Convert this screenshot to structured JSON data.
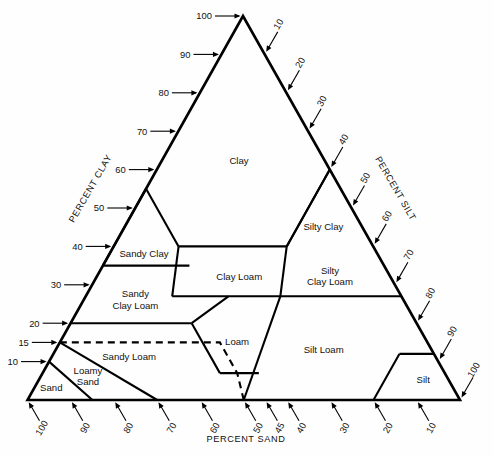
{
  "figure": {
    "line_color": "#000000",
    "background": "#fefefe"
  },
  "axes": {
    "left": {
      "name": "PERCENT CLAY",
      "label": "PERCENT CLAY",
      "ticks": [
        "100",
        "90",
        "80",
        "70",
        "60",
        "50",
        "40",
        "30",
        "20",
        "15",
        "10"
      ],
      "tick_values": [
        100,
        90,
        80,
        70,
        60,
        50,
        40,
        30,
        20,
        15,
        10
      ]
    },
    "right": {
      "name": "PERCENT SILT",
      "label": "PERCENT SILT",
      "ticks": [
        "10",
        "20",
        "30",
        "40",
        "50",
        "60",
        "70",
        "80",
        "90",
        "100"
      ],
      "tick_values": [
        10,
        20,
        30,
        40,
        50,
        60,
        70,
        80,
        90,
        100
      ]
    },
    "bottom": {
      "name": "PERCENT SAND",
      "label": "PERCENT SAND",
      "ticks": [
        "100",
        "90",
        "80",
        "70",
        "60",
        "50",
        "45",
        "40",
        "30",
        "20",
        "10"
      ],
      "tick_values": [
        100,
        90,
        80,
        70,
        60,
        50,
        45,
        40,
        30,
        20,
        10
      ]
    }
  },
  "regions": [
    {
      "id": "clay",
      "label": "Clay",
      "lines": [
        "Clay"
      ]
    },
    {
      "id": "silty-clay",
      "label": "Silty Clay",
      "lines": [
        "Silty Clay"
      ]
    },
    {
      "id": "sandy-clay",
      "label": "Sandy Clay",
      "lines": [
        "Sandy Clay"
      ]
    },
    {
      "id": "clay-loam",
      "label": "Clay Loam",
      "lines": [
        "Clay Loam"
      ]
    },
    {
      "id": "silty-clay-loam",
      "label": "Silty Clay Loam",
      "lines": [
        "Silty",
        "Clay Loam"
      ]
    },
    {
      "id": "sandy-clay-loam",
      "label": "Sandy Clay Loam",
      "lines": [
        "Sandy",
        "Clay Loam"
      ]
    },
    {
      "id": "loam",
      "label": "Loam",
      "lines": [
        "Loam"
      ]
    },
    {
      "id": "silt-loam",
      "label": "Silt Loam",
      "lines": [
        "Silt Loam"
      ]
    },
    {
      "id": "sandy-loam",
      "label": "Sandy Loam",
      "lines": [
        "Sandy Loam"
      ]
    },
    {
      "id": "loamy-sand",
      "label": "Loamy Sand",
      "lines": [
        "Loamy",
        "Sand"
      ]
    },
    {
      "id": "sand",
      "label": "Sand",
      "lines": [
        "Sand"
      ]
    },
    {
      "id": "silt",
      "label": "Silt",
      "lines": [
        "Silt"
      ]
    }
  ],
  "chart_data": {
    "type": "ternary",
    "components": [
      "clay",
      "silt",
      "sand"
    ],
    "axis_ranges": {
      "clay": [
        0,
        100
      ],
      "silt": [
        0,
        100
      ],
      "sand": [
        0,
        100
      ]
    },
    "grid": false,
    "legend": "none",
    "class_polygons": {
      "clay": [
        [
          100,
          0,
          0
        ],
        [
          55,
          0,
          45
        ],
        [
          40,
          15,
          45
        ],
        [
          40,
          40,
          20
        ],
        [
          60,
          40,
          0
        ]
      ],
      "silty_clay": [
        [
          60,
          40,
          0
        ],
        [
          40,
          40,
          20
        ],
        [
          40,
          60,
          0
        ]
      ],
      "sandy_clay": [
        [
          55,
          0,
          45
        ],
        [
          35,
          0,
          65
        ],
        [
          35,
          20,
          45
        ]
      ],
      "clay_loam": [
        [
          40,
          15,
          45
        ],
        [
          27,
          20,
          53
        ],
        [
          27,
          45,
          28
        ],
        [
          40,
          40,
          20
        ]
      ],
      "silty_clay_loam": [
        [
          40,
          40,
          20
        ],
        [
          27,
          45,
          28
        ],
        [
          27,
          73,
          0
        ],
        [
          40,
          60,
          0
        ]
      ],
      "sandy_clay_loam": [
        [
          35,
          0,
          65
        ],
        [
          20,
          0,
          80
        ],
        [
          20,
          28,
          52
        ],
        [
          27,
          33,
          40
        ],
        [
          27,
          20,
          53
        ]
      ],
      "loam": [
        [
          27,
          28,
          45
        ],
        [
          7,
          50,
          43
        ],
        [
          7,
          42,
          51
        ],
        [
          20,
          42,
          38
        ],
        [
          20,
          28,
          52
        ]
      ],
      "silt_loam": [
        [
          27,
          45,
          28
        ],
        [
          12,
          50,
          38
        ],
        [
          0,
          80,
          20
        ],
        [
          0,
          88,
          12
        ],
        [
          27,
          73,
          0
        ]
      ],
      "sandy_loam": [
        [
          20,
          0,
          80
        ],
        [
          7,
          0,
          93
        ],
        [
          7,
          30,
          63
        ],
        [
          20,
          28,
          52
        ]
      ],
      "loamy_sand": [
        [
          10,
          0,
          90
        ],
        [
          0,
          15,
          85
        ],
        [
          0,
          0,
          100
        ]
      ],
      "sand": [
        [
          10,
          0,
          90
        ],
        [
          0,
          10,
          90
        ],
        [
          0,
          0,
          100
        ]
      ],
      "silt": [
        [
          12,
          80,
          8
        ],
        [
          0,
          88,
          12
        ],
        [
          0,
          100,
          0
        ],
        [
          12,
          88,
          0
        ]
      ]
    }
  }
}
